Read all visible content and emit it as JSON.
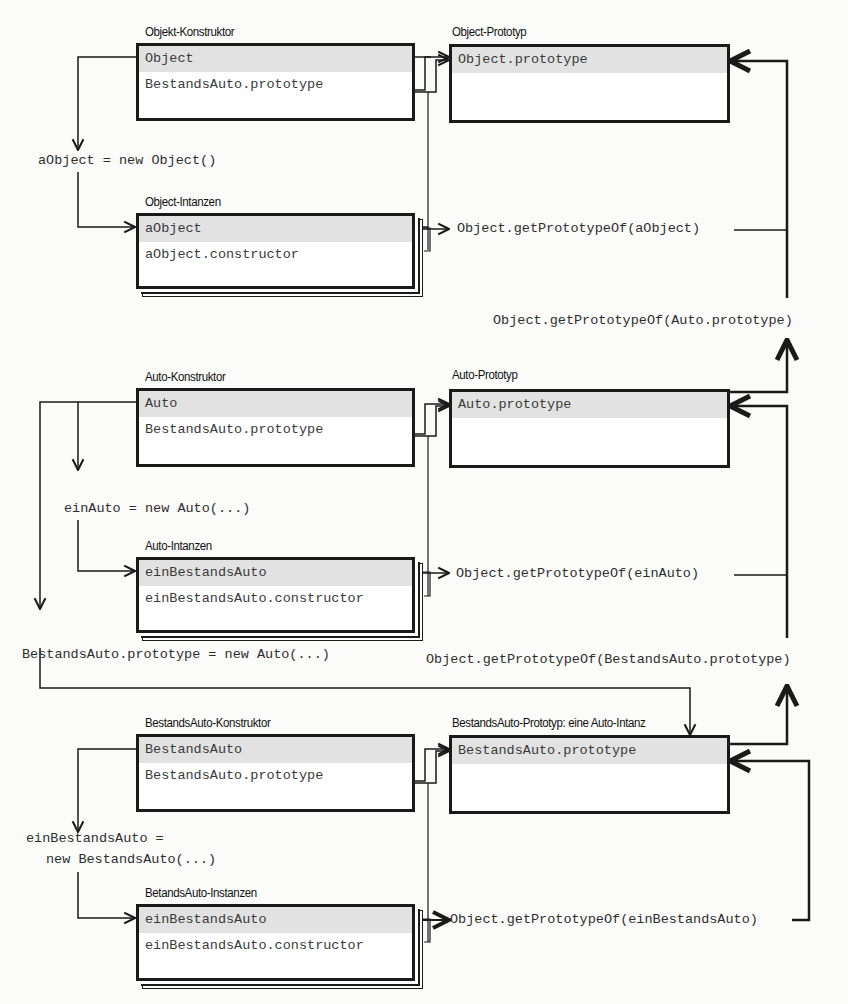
{
  "boxes": {
    "object_constructor": {
      "title": "Objekt-Konstruktor",
      "rows": [
        "Object",
        "BestandsAuto.prototype"
      ]
    },
    "object_prototype": {
      "title": "Object-Prototyp",
      "rows": [
        "Object.prototype"
      ]
    },
    "object_instances": {
      "title": "Object-Intanzen",
      "rows": [
        "aObject",
        "aObject.constructor"
      ]
    },
    "auto_constructor": {
      "title": "Auto-Konstruktor",
      "rows": [
        "Auto",
        "BestandsAuto.prototype"
      ]
    },
    "auto_prototype": {
      "title": "Auto-Prototyp",
      "rows": [
        "Auto.prototype"
      ]
    },
    "auto_instances": {
      "title": "Auto-Intanzen",
      "rows": [
        "einBestandsAuto",
        "einBestandsAuto.constructor"
      ]
    },
    "bestandsauto_constructor": {
      "title": "BestandsAuto-Konstruktor",
      "rows": [
        "BestandsAuto",
        "BestandsAuto.prototype"
      ]
    },
    "bestandsauto_prototype": {
      "title": "BestandsAuto-Prototyp: eine Auto-Intanz",
      "rows": [
        "BestandsAuto.prototype"
      ]
    },
    "bestandsauto_instances": {
      "title": "BetandsAuto-Instanzen",
      "rows": [
        "einBestandsAuto",
        "einBestandsAuto.constructor"
      ]
    }
  },
  "statements": {
    "new_object": "aObject = new Object()",
    "new_auto": "einAuto = new Auto(...)",
    "bestandsauto_prototype_assign": "BestandsAuto.prototype = new Auto(...)",
    "new_bestandsauto_line1": "einBestandsAuto =",
    "new_bestandsauto_line2": "new BestandsAuto(...)"
  },
  "calls": {
    "proto_of_aobject": "Object.getPrototypeOf(aObject)",
    "proto_of_auto_prototype": "Object.getPrototypeOf(Auto.prototype)",
    "proto_of_einauto": "Object.getPrototypeOf(einAuto)",
    "proto_of_bestandsauto_prototype": "Object.getPrototypeOf(BestandsAuto.prototype)",
    "proto_of_einbestandsauto": "Object.getPrototypeOf(einBestandsAuto)"
  }
}
